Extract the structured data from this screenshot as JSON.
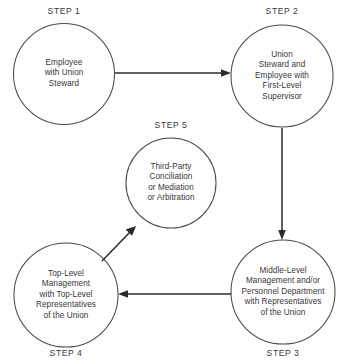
{
  "diagram": {
    "type": "flow-cycle",
    "title": "",
    "background_color": "#fefefe",
    "line_color": "#2b2b2b",
    "circle_stroke_color": "#4a4a4a",
    "text_color": "#38383a",
    "nodes": [
      {
        "id": "step1",
        "caption": "STEP 1",
        "caption_position": "above",
        "text": "Employee\nwith Union\nSteward",
        "cx": 64,
        "cy": 74,
        "r": 50.5
      },
      {
        "id": "step2",
        "caption": "STEP 2",
        "caption_position": "above",
        "text": "Union\nSteward and\nEmployee with\nFirst-Level\nSupervisor",
        "cx": 282,
        "cy": 76,
        "r": 51
      },
      {
        "id": "step3",
        "caption": "STEP 3",
        "caption_position": "below",
        "text": "Middle-Level\nManagement and/or\nPersonnel Department\nwith Representatives\nof the Union",
        "cx": 283,
        "cy": 292,
        "r": 52
      },
      {
        "id": "step4",
        "caption": "STEP 4",
        "caption_position": "below",
        "text": "Top-Level\nManagement\nwith Top-Level\nRepresentatives\nof the Union",
        "cx": 66,
        "cy": 295,
        "r": 52
      },
      {
        "id": "step5",
        "caption": "STEP 5",
        "caption_position": "above",
        "text": "Third-Party\nConciliation\nor Mediation\nor Arbitration",
        "cx": 171,
        "cy": 183,
        "r": 45
      }
    ],
    "connections": [
      {
        "id": "step1-to-step2",
        "from": "step1",
        "to": "step2",
        "direction": "right",
        "x1": 115,
        "y1": 73,
        "x2": 229,
        "y2": 73
      },
      {
        "id": "step2-to-step3",
        "from": "step2",
        "to": "step3",
        "direction": "down",
        "x1": 282,
        "y1": 128,
        "x2": 282,
        "y2": 238
      },
      {
        "id": "step3-to-step4",
        "from": "step3",
        "to": "step4",
        "direction": "left",
        "x1": 230,
        "y1": 294,
        "x2": 120,
        "y2": 294
      },
      {
        "id": "step4-to-step5",
        "from": "step4",
        "to": "step5",
        "direction": "up-right",
        "x1": 103,
        "y1": 260,
        "x2": 136,
        "y2": 226
      }
    ],
    "captions": {
      "step1": "STEP 1",
      "step2": "STEP 2",
      "step3": "STEP 3",
      "step4": "STEP 4",
      "step5": "STEP 5"
    },
    "caption_positions": [
      {
        "id": "step1",
        "x": 64,
        "y": 11
      },
      {
        "id": "step2",
        "x": 282,
        "y": 11
      },
      {
        "id": "step5",
        "x": 171,
        "y": 125
      },
      {
        "id": "step4",
        "x": 66,
        "y": 353
      },
      {
        "id": "step3",
        "x": 283,
        "y": 353
      }
    ]
  }
}
